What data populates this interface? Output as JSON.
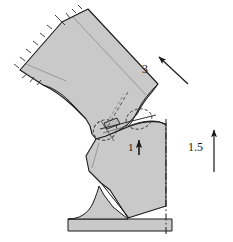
{
  "figure": {
    "background_color": "#ffffff",
    "body_fill": "#c9c9c9",
    "body_fill_light": "#d2d2d2",
    "outline_color": "#1a1a1a",
    "thin_line_color": "#6e6e6e",
    "dash_color": "#333333"
  },
  "annotations": {
    "velocity_upper": {
      "label": "3",
      "icon": "arrow-up-left-icon",
      "direction": "up-left",
      "angle_deg": 40
    },
    "velocity_lower": {
      "label": "1.5",
      "icon": "arrow-up-icon",
      "direction": "up",
      "angle_deg": 90
    },
    "contact_force": {
      "label": "1",
      "icon": "arrow-up-icon",
      "direction": "up",
      "angle_deg": 90
    }
  },
  "parts": {
    "upper_body": "upper-tilted-body",
    "lower_body": "lower-body",
    "base": "base-foot",
    "contact_zone": "contact-region",
    "centerline": "vertical-centerline",
    "fixed_edge": "hatched-fixed-boundary"
  }
}
